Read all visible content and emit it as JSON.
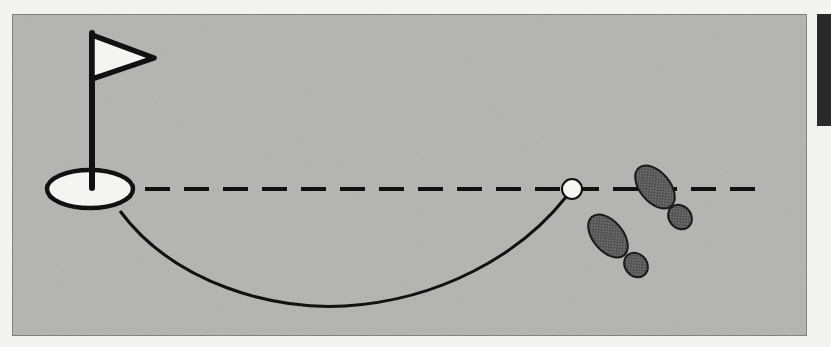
{
  "diagram": {
    "title": "",
    "colors": {
      "page_background": "#f3f3f1",
      "panel_fill": "#b4b4b2",
      "panel_border": "#6e6e6e",
      "stroke": "#111111",
      "hole_fill": "#f4f4f2",
      "ball_fill": "#f6f6f4",
      "flag_fill": "#f4f4f2",
      "footprint_fill": "#6a6a6a",
      "side_tab": "#2a2a2a"
    },
    "elements": {
      "panel": {
        "x": 12,
        "y": 14,
        "width": 795,
        "height": 322
      },
      "hole": {
        "cx": 90,
        "cy": 189,
        "rx": 43,
        "ry": 19
      },
      "flagstick": {
        "x": 92,
        "y_top": 33,
        "y_bottom": 188
      },
      "flag": {
        "points": "92,33 156,58 92,80"
      },
      "aim_line": {
        "x1": 145,
        "x2": 765,
        "y": 189,
        "dash": 25,
        "gap": 14,
        "style": "dashed"
      },
      "ball": {
        "cx": 572,
        "cy": 189,
        "r": 10
      },
      "putt_path": {
        "start": [
          120,
          211
        ],
        "low_point": [
          330,
          307
        ],
        "end": [
          566,
          197
        ],
        "style": "solid curve"
      },
      "footprints": [
        {
          "name": "front-shoe",
          "sole_center": [
            655,
            190
          ],
          "heel_center": [
            680,
            217
          ]
        },
        {
          "name": "back-shoe",
          "sole_center": [
            610,
            238
          ],
          "heel_center": [
            635,
            265
          ]
        }
      ]
    },
    "labels": []
  }
}
